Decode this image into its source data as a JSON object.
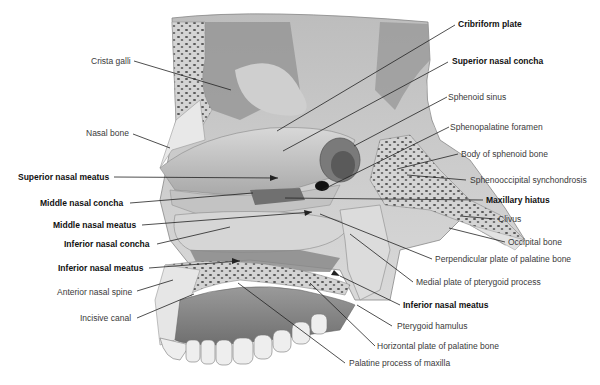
{
  "figure": {
    "type": "anatomical illustration",
    "colors": {
      "background": "#ffffff",
      "bone_light": "#e4e4e4",
      "bone_mid": "#c4c4c4",
      "bone_dark": "#8a8a8a",
      "cavity_dark": "#5e5e5e",
      "leader_line": "#222222",
      "label_regular": "#3a3a3a",
      "label_bold": "#111111"
    }
  },
  "labels": {
    "crista_galli": "Crista galli",
    "nasal_bone": "Nasal bone",
    "superior_nasal_meatus": "Superior nasal meatus",
    "middle_nasal_concha": "Middle nasal concha",
    "middle_nasal_meatus": "Middle nasal meatus",
    "inferior_nasal_concha": "Inferior nasal concha",
    "inferior_nasal_meatus_left": "Inferior nasal meatus",
    "anterior_nasal_spine": "Anterior nasal spine",
    "incisive_canal": "Incisive canal",
    "cribriform_plate": "Cribriform plate",
    "superior_nasal_concha": "Superior nasal concha",
    "sphenoid_sinus": "Sphenoid sinus",
    "sphenopalatine_foramen": "Sphenopalatine foramen",
    "body_of_sphenoid_bone": "Body of sphenoid bone",
    "sphenooccipital_synchondrosis": "Sphenooccipital synchondrosis",
    "maxillary_hiatus": "Maxillary hiatus",
    "clivus": "Clivus",
    "occipital_bone": "Occipital bone",
    "perpendicular_plate_palatine": "Perpendicular plate of palatine bone",
    "medial_plate_pterygoid": "Medial plate of pterygoid process",
    "inferior_nasal_meatus_right": "Inferior nasal meatus",
    "pterygoid_hamulus": "Pterygoid hamulus",
    "horizontal_plate_palatine": "Horizontal plate of palatine bone",
    "palatine_process_maxilla": "Palatine process of maxilla"
  }
}
